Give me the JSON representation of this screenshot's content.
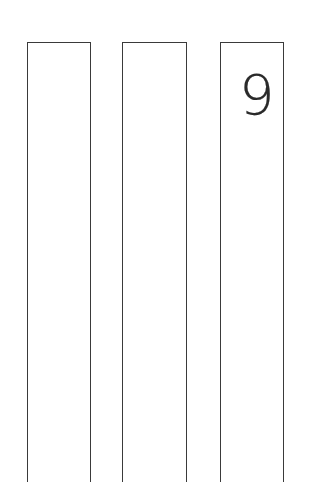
{
  "slots": [
    {
      "label": "",
      "value": ""
    },
    {
      "label": "",
      "value": ""
    },
    {
      "label": "",
      "value": "9"
    }
  ],
  "colors": {
    "border": "#3a3a3a",
    "digit": "#2a2a2a",
    "background": "#ffffff"
  }
}
